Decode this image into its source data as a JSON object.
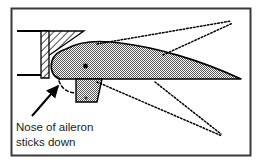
{
  "figure": {
    "background_color": "#ffffff",
    "border_color": "#3a3a3a",
    "line_color": "#000000",
    "fill_pattern_color": "#000000",
    "caption": {
      "line1": "Nose of aileron",
      "line2": "sticks down"
    },
    "parts": [
      {
        "name": "wing-spar",
        "label": "wing spar web",
        "fill": "diagonal-hatch"
      },
      {
        "name": "spar-gusset",
        "label": "spar gusset",
        "fill": "diagonal-hatch"
      },
      {
        "name": "aileron-body",
        "label": "aileron section",
        "fill": "checker-stipple"
      },
      {
        "name": "aileron-horn",
        "label": "aileron control horn",
        "fill": "checker-stipple"
      },
      {
        "name": "hinge-point",
        "label": "hinge pivot",
        "fill": "solid"
      }
    ],
    "annotations": [
      {
        "name": "nose-callout-arrow",
        "style": "solid-arrow",
        "points_to": "aileron nose"
      },
      {
        "name": "nose-travel-arc",
        "style": "dashed-curve",
        "describes": "downward nose travel"
      },
      {
        "name": "upper-travel-lines",
        "style": "dotted",
        "count": 2,
        "converges_at": "upper right"
      },
      {
        "name": "lower-travel-lines",
        "style": "dotted",
        "count": 2,
        "converges_at": "lower right"
      }
    ]
  }
}
